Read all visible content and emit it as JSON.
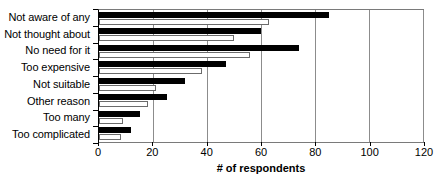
{
  "chart_data": {
    "type": "bar",
    "orientation": "horizontal",
    "title": "",
    "xlabel": "# of respondents",
    "ylabel": "",
    "xlim": [
      0,
      120
    ],
    "xticks": [
      0,
      20,
      40,
      60,
      80,
      100,
      120
    ],
    "grid": true,
    "legend": "none",
    "categories": [
      "Not aware of any",
      "Not thought about",
      "No need for it",
      "Too expensive",
      "Not suitable",
      "Other reason",
      "Too many",
      "Too complicated"
    ],
    "series": [
      {
        "name": "series-a",
        "style": "filled-black",
        "color": "#000000",
        "values": [
          85,
          60,
          74,
          47,
          32,
          25,
          15,
          12
        ]
      },
      {
        "name": "series-b",
        "style": "hollow-white",
        "color": "#ffffff",
        "values": [
          63,
          50,
          56,
          38,
          21,
          18,
          9,
          8
        ]
      }
    ]
  },
  "axis": {
    "tick_labels": [
      "0",
      "20",
      "40",
      "60",
      "80",
      "100",
      "120"
    ],
    "title": "# of respondents"
  },
  "colors": {
    "series_a_fill": "#000000",
    "series_b_fill": "#ffffff",
    "series_b_border": "#6b6b6b",
    "gridline": "#8c8c8c",
    "frame": "#7a7a7a",
    "background": "#ffffff"
  }
}
